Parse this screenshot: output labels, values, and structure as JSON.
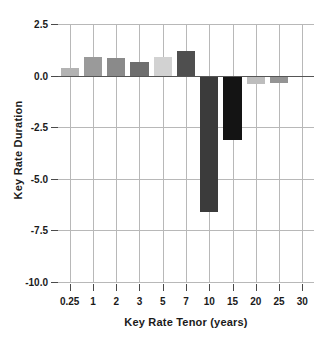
{
  "chart_data": {
    "type": "bar",
    "title": "",
    "xlabel": "Key Rate Tenor (years)",
    "ylabel": "Key Rate Duration",
    "categories": [
      "0.25",
      "1",
      "2",
      "3",
      "5",
      "7",
      "10",
      "15",
      "20",
      "25",
      "30"
    ],
    "values": [
      0.35,
      0.9,
      0.85,
      0.65,
      0.9,
      1.2,
      -6.6,
      -3.1,
      -0.4,
      -0.35,
      -0.05
    ],
    "bar_colors": [
      "#b3b3b3",
      "#9a9a9a",
      "#8a8a8a",
      "#6e6e6e",
      "#d2d2d2",
      "#4f4f4f",
      "#3b3b3b",
      "#141414",
      "#bdbdbd",
      "#949494",
      "#7a7a7a"
    ],
    "ylim": [
      -10.0,
      2.5
    ],
    "yticks": [
      "2.5",
      "0.0",
      "-2.5",
      "-5.0",
      "-7.5",
      "-10.0"
    ],
    "ytick_values": [
      2.5,
      0.0,
      -2.5,
      -5.0,
      -7.5,
      -10.0
    ],
    "grid": true,
    "legend": "none",
    "zero_reference_line": true
  }
}
